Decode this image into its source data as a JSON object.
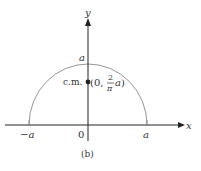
{
  "figure": {
    "caption": "(b)",
    "axes": {
      "x_label": "x",
      "y_label": "y",
      "origin_label": "0",
      "neg_a_label": "−a",
      "pos_a_label": "a",
      "top_a_label": "a"
    },
    "center_of_mass": {
      "label": "c.m.",
      "coord_open": "(0,",
      "frac_num": "2",
      "frac_den": "π",
      "coord_var": "a",
      "coord_close": ")"
    },
    "shape": "semicircle",
    "colors": {
      "axis": "#222222",
      "curve": "#888888",
      "text": "#333333"
    }
  }
}
